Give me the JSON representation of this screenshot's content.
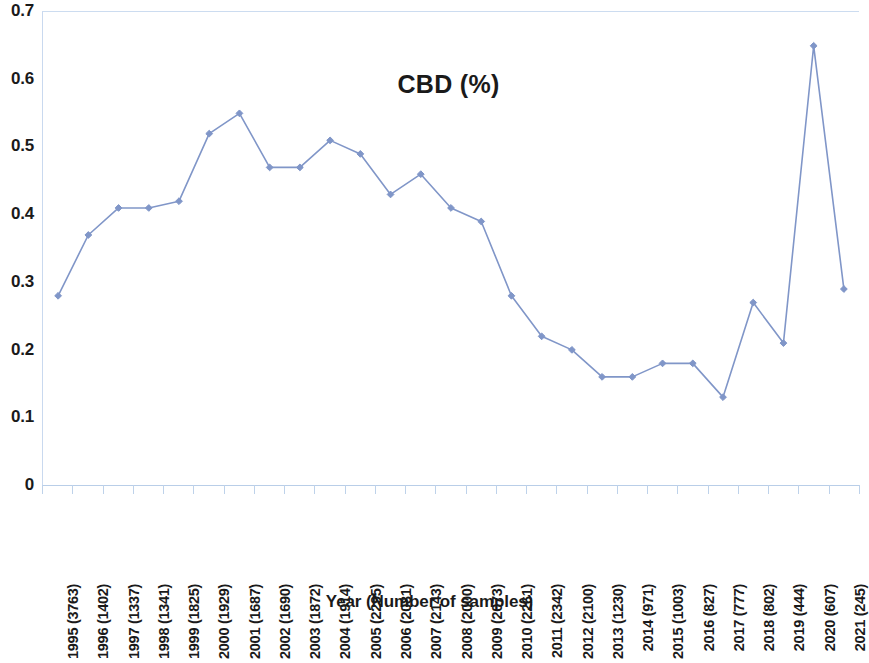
{
  "chart_data": {
    "type": "line",
    "title": "CBD (%)",
    "xlabel": "Year (Number of samples)",
    "ylabel": "",
    "ylim": [
      0,
      0.7
    ],
    "ytick_labels": [
      "0.7",
      "0.6",
      "0.5",
      "0.4",
      "0.3",
      "0.2",
      "0.1",
      "0"
    ],
    "ytick_values": [
      0.7,
      0.6,
      0.5,
      0.4,
      0.3,
      0.2,
      0.1,
      0
    ],
    "grid": false,
    "legend": "none",
    "marker": "diamond",
    "series_color": "#8096c8",
    "categories": [
      "1995 (3763)",
      "1996 (1402)",
      "1997 (1337)",
      "1998 (1341)",
      "1999 (1825)",
      "2000 (1929)",
      "2001 (1687)",
      "2002 (1690)",
      "2003 (1872)",
      "2004 (1914)",
      "2005 (2295)",
      "2006 (2081)",
      "2007 (2143)",
      "2008 (2000)",
      "2009 (2073)",
      "2010 (2261)",
      "2011 (2342)",
      "2012 (2100)",
      "2013 (1230)",
      "2014 (971)",
      "2015 (1003)",
      "2016 (827)",
      "2017 (777)",
      "2018 (802)",
      "2019 (444)",
      "2020 (607)",
      "2021 (245)"
    ],
    "years": [
      1995,
      1996,
      1997,
      1998,
      1999,
      2000,
      2001,
      2002,
      2003,
      2004,
      2005,
      2006,
      2007,
      2008,
      2009,
      2010,
      2011,
      2012,
      2013,
      2014,
      2015,
      2016,
      2017,
      2018,
      2019,
      2020,
      2021
    ],
    "sample_counts": [
      3763,
      1402,
      1337,
      1341,
      1825,
      1929,
      1687,
      1690,
      1872,
      1914,
      2295,
      2081,
      2143,
      2000,
      2073,
      2261,
      2342,
      2100,
      1230,
      971,
      1003,
      827,
      777,
      802,
      444,
      607,
      245
    ],
    "values": [
      0.28,
      0.37,
      0.41,
      0.41,
      0.42,
      0.52,
      0.55,
      0.47,
      0.47,
      0.51,
      0.49,
      0.43,
      0.46,
      0.41,
      0.39,
      0.28,
      0.22,
      0.2,
      0.16,
      0.16,
      0.18,
      0.18,
      0.13,
      0.27,
      0.21,
      0.65,
      0.29
    ]
  }
}
